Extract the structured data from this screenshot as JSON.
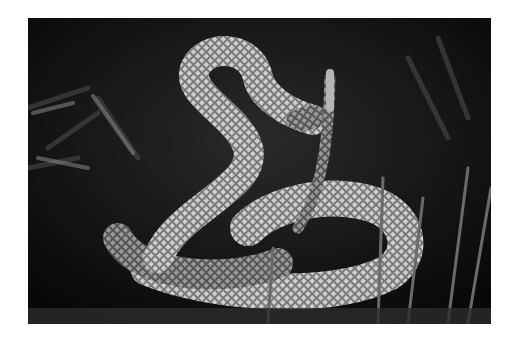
{
  "image": {
    "description": "Black and white photograph of a rattlesnake coiled in a defensive striking posture with its rattle raised, among grass",
    "subject": "rattlesnake",
    "style": "monochrome",
    "colors": {
      "frame": "#ffffff",
      "background_dark": "#0c0c0c",
      "snake_light": "#bdbdbd",
      "snake_mid": "#6e6e6e",
      "snake_dark": "#2a2a2a"
    }
  }
}
